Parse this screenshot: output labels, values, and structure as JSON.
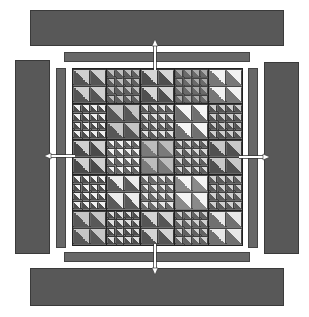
{
  "diagram": {
    "colors": {
      "panel": "#585858",
      "strip": "#676767",
      "grid_line": "#222222",
      "arrow": "#ffffff",
      "background": "#ffffff"
    },
    "grid": {
      "rows": 5,
      "cols": 5,
      "block_pattern": [
        [
          "large",
          "small",
          "large",
          "small",
          "large"
        ],
        [
          "small",
          "large",
          "small",
          "large",
          "small"
        ],
        [
          "large",
          "small",
          "large",
          "small",
          "large"
        ],
        [
          "small",
          "large",
          "small",
          "large",
          "small"
        ],
        [
          "large",
          "small",
          "large",
          "small",
          "large"
        ]
      ],
      "large_block_units": 2,
      "small_block_units": 4,
      "unit": "half-square triangle (light upper-right, dark lower-left)",
      "block_shades": [
        [
          [
            "#cfcfcf",
            "#555555"
          ],
          [
            "#bdbdbd",
            "#5e5e5e"
          ],
          [
            "#d6d6d6",
            "#4f4f4f"
          ],
          [
            "#a9a9a9",
            "#6a6a6a"
          ],
          [
            "#f2f2f2",
            "#777777"
          ]
        ],
        [
          [
            "#ededed",
            "#4c4c4c"
          ],
          [
            "#c4c4c4",
            "#575757"
          ],
          [
            "#e0e0e0",
            "#5b5b5b"
          ],
          [
            "#f5f5f5",
            "#6f6f6f"
          ],
          [
            "#cccccc",
            "#535353"
          ]
        ],
        [
          [
            "#d0d0d0",
            "#4a4a4a"
          ],
          [
            "#f0f0f0",
            "#626262"
          ],
          [
            "#bcbcbc",
            "#7a7a7a"
          ],
          [
            "#d9d9d9",
            "#5d5d5d"
          ],
          [
            "#c8c8c8",
            "#505050"
          ]
        ],
        [
          [
            "#f0f0f0",
            "#4f4f4f"
          ],
          [
            "#ececec",
            "#5a5a5a"
          ],
          [
            "#e6e6e6",
            "#6a6a6a"
          ],
          [
            "#f4f4f4",
            "#8a8a8a"
          ],
          [
            "#cfcfcf",
            "#5a5a5a"
          ]
        ],
        [
          [
            "#c6c6c6",
            "#585858"
          ],
          [
            "#dedede",
            "#4d4d4d"
          ],
          [
            "#d4d4d4",
            "#555555"
          ],
          [
            "#d0d0d0",
            "#626262"
          ],
          [
            "#e8e8e8",
            "#707070"
          ]
        ]
      ]
    },
    "panels": [
      {
        "name": "top-border-panel",
        "x": 30,
        "y": 10,
        "w": 254,
        "h": 36
      },
      {
        "name": "bottom-border-panel",
        "x": 30,
        "y": 268,
        "w": 254,
        "h": 38
      },
      {
        "name": "left-border-panel",
        "x": 15,
        "y": 60,
        "w": 35,
        "h": 194
      },
      {
        "name": "right-border-panel",
        "x": 264,
        "y": 62,
        "w": 35,
        "h": 192
      }
    ],
    "strips": [
      {
        "name": "top-inner-strip",
        "x": 64,
        "y": 52,
        "w": 186,
        "h": 10
      },
      {
        "name": "bottom-inner-strip",
        "x": 64,
        "y": 252,
        "w": 186,
        "h": 10
      },
      {
        "name": "left-inner-strip",
        "x": 56,
        "y": 68,
        "w": 10,
        "h": 180
      },
      {
        "name": "right-inner-strip",
        "x": 248,
        "y": 68,
        "w": 10,
        "h": 180
      }
    ],
    "arrows": [
      {
        "name": "arrow-up",
        "direction": "up"
      },
      {
        "name": "arrow-down",
        "direction": "down"
      },
      {
        "name": "arrow-left",
        "direction": "left"
      },
      {
        "name": "arrow-right",
        "direction": "right"
      }
    ]
  }
}
